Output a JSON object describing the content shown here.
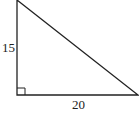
{
  "diagram": {
    "type": "right-triangle",
    "labels": {
      "vertical_leg": "15",
      "horizontal_leg": "20"
    },
    "right_angle_marker": true,
    "colors": {
      "stroke": "#222222",
      "background": "#ffffff"
    }
  }
}
